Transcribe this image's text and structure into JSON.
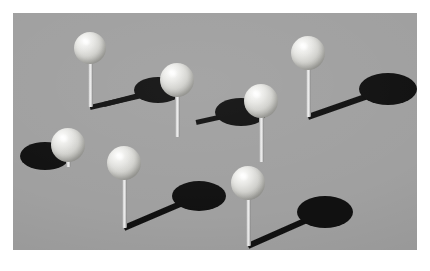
{
  "scene": {
    "title": "Ball and pin shadow scene",
    "description": "Seven light spheres mounted on thin vertical pins standing on a flat gray plane, each casting a dark elliptical shadow.",
    "canvas": {
      "width": 430,
      "height": 271,
      "background_color": "#ffffff"
    },
    "ground": {
      "name": "gray ground plane",
      "x": 13,
      "y": 13,
      "width": 404,
      "height": 237,
      "color": "#a0a0a0"
    },
    "colors": {
      "background": "#ffffff",
      "ground": "#a0a0a0",
      "ball_highlight": "#ffffff",
      "ball_midtone": "#d2d2ce",
      "ball_shade": "#7e7e7a",
      "pin": "#efefef",
      "pin_shade": "#8c8c8c",
      "shadow": "#111111"
    },
    "object_count": 7,
    "objects": [
      {
        "id": "pin-1",
        "label": "top left ball",
        "ball": {
          "cx": 90,
          "cy": 48,
          "r": 16
        },
        "pin": {
          "x": 88,
          "y": 60,
          "width": 5,
          "height": 47
        },
        "shadow_ellipse": {
          "cx": 64,
          "cy": 55,
          "rx": 0,
          "ry": 0
        },
        "shadow_stem": {
          "x1": 90,
          "y1": 107,
          "x2": 168,
          "y2": 89,
          "thickness": 5
        },
        "has_visible_shadow_ellipse": false
      },
      {
        "id": "pin-2",
        "label": "upper middle ball",
        "ball": {
          "cx": 177,
          "cy": 80,
          "r": 17
        },
        "pin": {
          "x": 175,
          "y": 92,
          "width": 5,
          "height": 45
        },
        "shadow_ellipse": {
          "cx": 158,
          "cy": 90,
          "rx": 24,
          "ry": 13
        },
        "shadow_stem": {
          "x1": 158,
          "y1": 90,
          "x2": 104,
          "y2": 104,
          "thickness": 5
        },
        "has_visible_shadow_ellipse": true
      },
      {
        "id": "pin-3",
        "label": "center ball",
        "ball": {
          "cx": 261,
          "cy": 101,
          "r": 17
        },
        "pin": {
          "x": 259,
          "y": 113,
          "width": 5,
          "height": 49
        },
        "shadow_ellipse": {
          "cx": 241,
          "cy": 112,
          "rx": 26,
          "ry": 14
        },
        "shadow_stem": {
          "x1": 241,
          "y1": 112,
          "x2": 196,
          "y2": 122,
          "thickness": 5
        },
        "has_visible_shadow_ellipse": true
      },
      {
        "id": "pin-4",
        "label": "top right ball",
        "ball": {
          "cx": 308,
          "cy": 53,
          "r": 17
        },
        "pin": {
          "x": 306,
          "y": 65,
          "width": 5,
          "height": 52
        },
        "shadow_ellipse": {
          "cx": 388,
          "cy": 89,
          "rx": 29,
          "ry": 16
        },
        "shadow_stem": {
          "x1": 308,
          "y1": 117,
          "x2": 388,
          "y2": 89,
          "thickness": 6
        },
        "has_visible_shadow_ellipse": true
      },
      {
        "id": "pin-5",
        "label": "left ball",
        "ball": {
          "cx": 68,
          "cy": 145,
          "r": 17
        },
        "pin": {
          "x": 66,
          "y": 157,
          "width": 5,
          "height": 10
        },
        "shadow_ellipse": {
          "cx": 45,
          "cy": 156,
          "rx": 25,
          "ry": 14
        },
        "shadow_stem": {
          "x1": 45,
          "y1": 156,
          "x2": 22,
          "y2": 160,
          "thickness": 5
        },
        "has_visible_shadow_ellipse": true
      },
      {
        "id": "pin-6",
        "label": "lower middle ball",
        "ball": {
          "cx": 124,
          "cy": 163,
          "r": 17
        },
        "pin": {
          "x": 122,
          "y": 175,
          "width": 5,
          "height": 53
        },
        "shadow_ellipse": {
          "cx": 199,
          "cy": 196,
          "rx": 27,
          "ry": 15
        },
        "shadow_stem": {
          "x1": 124,
          "y1": 228,
          "x2": 199,
          "y2": 196,
          "thickness": 6
        },
        "has_visible_shadow_ellipse": true
      },
      {
        "id": "pin-7",
        "label": "bottom right ball",
        "ball": {
          "cx": 248,
          "cy": 183,
          "r": 17
        },
        "pin": {
          "x": 246,
          "y": 195,
          "width": 5,
          "height": 51
        },
        "shadow_ellipse": {
          "cx": 325,
          "cy": 212,
          "rx": 28,
          "ry": 16
        },
        "shadow_stem": {
          "x1": 248,
          "y1": 246,
          "x2": 325,
          "y2": 212,
          "thickness": 6
        },
        "has_visible_shadow_ellipse": true
      }
    ]
  }
}
